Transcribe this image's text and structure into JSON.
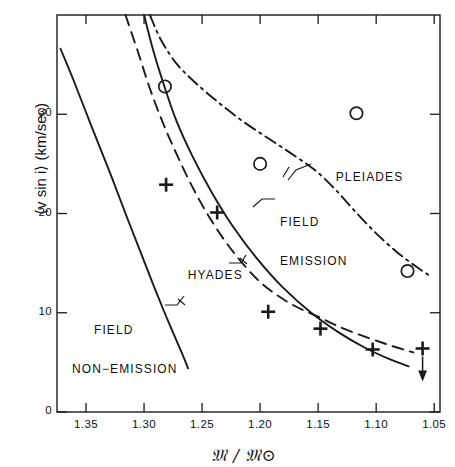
{
  "figure": {
    "title": "",
    "x_axis_label": "𝔐 / 𝔐⊙",
    "x_axis_label_plain": "M / M_sun",
    "y_axis_label": "⟨v sin i⟩  (km/sec)"
  },
  "annotations": {
    "pleiades": "PLEIADES",
    "field_emission_line1": "FIELD",
    "field_emission_line2": "EMISSION",
    "hyades": "HYADES",
    "field_nonemission_line1": "FIELD",
    "field_nonemission_line2": "NON−EMISSION"
  },
  "chart_data": {
    "type": "line",
    "title": "",
    "xlabel": "M / M_sun",
    "ylabel": "<v sin i> (km/sec)",
    "xlim": [
      1.375,
      1.045
    ],
    "ylim": [
      0,
      40
    ],
    "x_reversed": true,
    "grid": false,
    "legend_position": "inline-annotations",
    "xticks": [
      1.35,
      1.3,
      1.25,
      1.2,
      1.15,
      1.1,
      1.05
    ],
    "xtick_labels": [
      "1.35",
      "1.30",
      "1.25",
      "1.20",
      "1.15",
      "1.10",
      "1.05"
    ],
    "yticks": [
      0,
      10,
      20,
      30
    ],
    "ytick_labels": [
      "0",
      "10",
      "20",
      "30"
    ],
    "series": [
      {
        "name": "FIELD NON-EMISSION",
        "style": "solid",
        "x": [
          1.372,
          1.36,
          1.345,
          1.33,
          1.316,
          1.303,
          1.292,
          1.283,
          1.275,
          1.268,
          1.262
        ],
        "y": [
          36.6,
          33.2,
          28.7,
          24.3,
          20.0,
          16.1,
          12.8,
          10.2,
          8.0,
          6.1,
          4.4
        ]
      },
      {
        "name": "HYADES",
        "style": "dashed",
        "x": [
          1.316,
          1.305,
          1.295,
          1.284,
          1.272,
          1.258,
          1.242,
          1.223,
          1.2,
          1.175,
          1.15,
          1.128,
          1.105,
          1.085,
          1.068
        ],
        "y": [
          40.0,
          36.2,
          32.6,
          29.2,
          26.0,
          22.6,
          19.3,
          16.1,
          13.1,
          11.0,
          9.6,
          8.4,
          7.4,
          6.6,
          6.0
        ]
      },
      {
        "name": "FIELD EMISSION",
        "style": "solid",
        "x": [
          1.3,
          1.292,
          1.283,
          1.272,
          1.258,
          1.242,
          1.224,
          1.203,
          1.18,
          1.156,
          1.132,
          1.11,
          1.09,
          1.072
        ],
        "y": [
          40.0,
          36.4,
          33.0,
          29.3,
          25.7,
          22.2,
          18.8,
          15.5,
          12.5,
          10.0,
          8.0,
          6.5,
          5.4,
          4.6
        ]
      },
      {
        "name": "PLEIADES",
        "style": "dash-dot",
        "x": [
          1.295,
          1.285,
          1.272,
          1.256,
          1.237,
          1.215,
          1.192,
          1.17,
          1.152,
          1.135,
          1.118,
          1.1,
          1.082,
          1.065,
          1.052
        ],
        "y": [
          40.0,
          37.4,
          35.1,
          33.2,
          31.3,
          29.3,
          27.5,
          25.8,
          24.3,
          22.4,
          20.2,
          18.0,
          16.1,
          14.6,
          13.6
        ]
      }
    ],
    "points": [
      {
        "marker": "circle",
        "label": "Pleiades mean",
        "x": 1.282,
        "y": 32.8
      },
      {
        "marker": "circle",
        "label": "Pleiades mean",
        "x": 1.2,
        "y": 25.0
      },
      {
        "marker": "circle",
        "label": "Pleiades mean",
        "x": 1.117,
        "y": 30.1
      },
      {
        "marker": "circle",
        "label": "Pleiades mean",
        "x": 1.073,
        "y": 14.2
      },
      {
        "marker": "plus",
        "label": "Hyades mean",
        "x": 1.281,
        "y": 22.9
      },
      {
        "marker": "plus",
        "label": "Hyades mean",
        "x": 1.237,
        "y": 20.1
      },
      {
        "marker": "plus",
        "label": "Hyades mean",
        "x": 1.193,
        "y": 10.1
      },
      {
        "marker": "plus",
        "label": "Hyades mean",
        "x": 1.148,
        "y": 8.4
      },
      {
        "marker": "plus",
        "label": "Hyades mean",
        "x": 1.103,
        "y": 6.3
      },
      {
        "marker": "plus",
        "label": "Hyades mean, upper limit",
        "x": 1.06,
        "y": 6.4,
        "upper_limit": true
      }
    ]
  }
}
